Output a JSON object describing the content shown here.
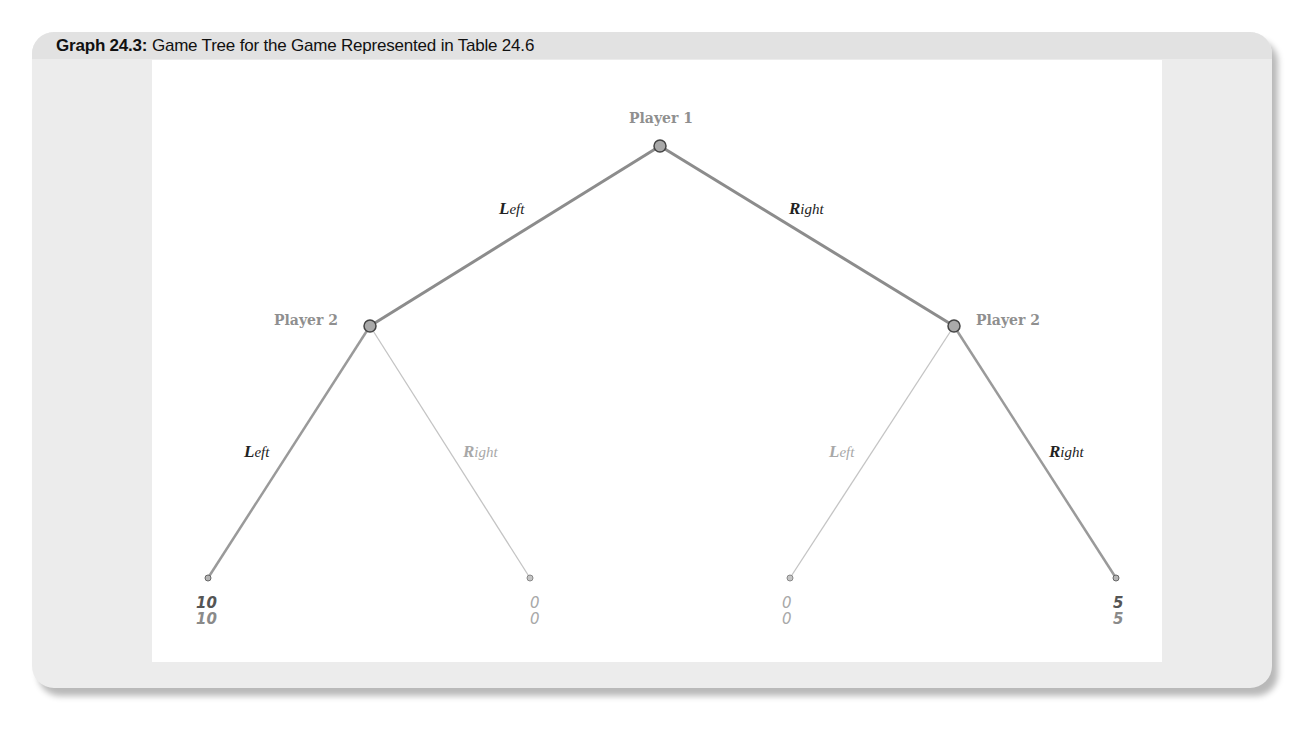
{
  "figure": {
    "label": "Graph 24.3:",
    "caption": "Game Tree for the Game Represented in Table 24.6"
  },
  "colors": {
    "frame_bg": "#ececec",
    "title_bg": "#e2e2e2",
    "panel_bg": "#ffffff",
    "primary_branch": "#8c8c8c",
    "secondary_branch": "#bdbdbd",
    "node_fill": "#a9a9a9",
    "node_stroke": "#444444",
    "player_label": "#8f8f8f"
  },
  "tree": {
    "root": {
      "player": "Player 1",
      "x": 660,
      "y": 146,
      "moves": [
        {
          "initial": "L",
          "rest": "eft",
          "full": "Left"
        },
        {
          "initial": "R",
          "rest": "ight",
          "full": "Right"
        }
      ]
    },
    "nodes": [
      {
        "player": "Player 2",
        "reached_by": "Left",
        "x": 370,
        "y": 326,
        "moves": [
          {
            "initial": "L",
            "rest": "eft",
            "full": "Left",
            "emphasis": "dark"
          },
          {
            "initial": "R",
            "rest": "ight",
            "full": "Right",
            "emphasis": "light"
          }
        ]
      },
      {
        "player": "Player 2",
        "reached_by": "Right",
        "x": 954,
        "y": 326,
        "moves": [
          {
            "initial": "L",
            "rest": "eft",
            "full": "Left",
            "emphasis": "light"
          },
          {
            "initial": "R",
            "rest": "ight",
            "full": "Right",
            "emphasis": "dark"
          }
        ]
      }
    ],
    "leaves": [
      {
        "path": "Left-Left",
        "x": 208,
        "y": 578,
        "payoff_player1": "10",
        "payoff_player2": "10",
        "emphasis": "dark"
      },
      {
        "path": "Left-Right",
        "x": 530,
        "y": 578,
        "payoff_player1": "0",
        "payoff_player2": "0",
        "emphasis": "light"
      },
      {
        "path": "Right-Left",
        "x": 790,
        "y": 578,
        "payoff_player1": "0",
        "payoff_player2": "0",
        "emphasis": "light"
      },
      {
        "path": "Right-Right",
        "x": 1116,
        "y": 578,
        "payoff_player1": "5",
        "payoff_player2": "5",
        "emphasis": "dark"
      }
    ]
  }
}
